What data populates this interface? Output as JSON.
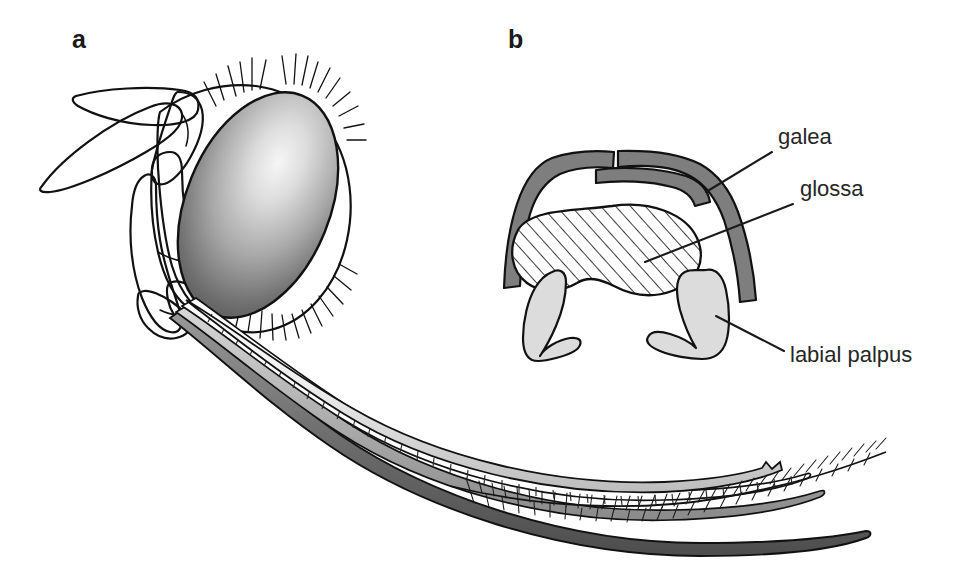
{
  "figure": {
    "background_color": "#ffffff",
    "width": 961,
    "height": 577,
    "panels": [
      {
        "id": "a",
        "letter": "a",
        "caption_position": {
          "x": 72,
          "y": 48
        },
        "description": "lateral view of bee head with antenna, compound eye and extended proboscis"
      },
      {
        "id": "b",
        "letter": "b",
        "caption_position": {
          "x": 508,
          "y": 48
        },
        "description": "transverse cross-section through the proboscis"
      }
    ]
  },
  "annotations": [
    {
      "id": "galea",
      "label": "galea",
      "text_x": 778,
      "text_y": 144,
      "leader": {
        "x1": 772,
        "y1": 152,
        "x2": 706,
        "y2": 192
      },
      "target_structure": "galea"
    },
    {
      "id": "glossa",
      "label": "glossa",
      "text_x": 800,
      "text_y": 196,
      "leader": {
        "x1": 793,
        "y1": 204,
        "x2": 645,
        "y2": 262
      },
      "target_structure": "glossa"
    },
    {
      "id": "labial-palpus",
      "label": "labial palpus",
      "text_x": 790,
      "text_y": 362,
      "leader": {
        "x1": 784,
        "y1": 351,
        "x2": 716,
        "y2": 316
      },
      "target_structure": "labial palpus"
    }
  ],
  "structures": {
    "galea": {
      "name": "galea",
      "fill_color": "#7e7e7e",
      "outline_color": "#111111",
      "note": "dark grey paired blades forming the upper arch of the cross-section"
    },
    "glossa": {
      "name": "glossa",
      "fill_color": "#ffffff",
      "hatch_color": "#1a1a1a",
      "outline_color": "#111111",
      "note": "central hatched bean-shaped element"
    },
    "labial_palpus": {
      "name": "labial palpus",
      "fill_color": "#dcdcdc",
      "outline_color": "#111111",
      "note": "pale grey paired crescents below the glossa"
    },
    "compound_eye": {
      "name": "compound eye",
      "gradient_light": "#f2f2f2",
      "gradient_dark": "#4a4a4a",
      "outline_color": "#111111"
    },
    "head_capsule": {
      "name": "head capsule",
      "fill_color": "#ffffff",
      "outline_color": "#111111"
    },
    "antenna": {
      "name": "antenna",
      "fill_color": "#ffffff",
      "outline_color": "#111111",
      "segments": 3
    },
    "proboscis_bundle": {
      "name": "proboscis",
      "strands": [
        {
          "name": "galea",
          "fill_color": "#c9c9c9"
        },
        {
          "name": "glossa",
          "fill_color": "#ffffff"
        },
        {
          "name": "labial palpus",
          "fill_color": "#8a8a8a"
        }
      ]
    }
  },
  "colors": {
    "ink": "#111111",
    "text": "#262626",
    "background": "#ffffff",
    "mid_grey": "#7e7e7e",
    "light_grey": "#dcdcdc",
    "dark_grey": "#4a4a4a"
  }
}
